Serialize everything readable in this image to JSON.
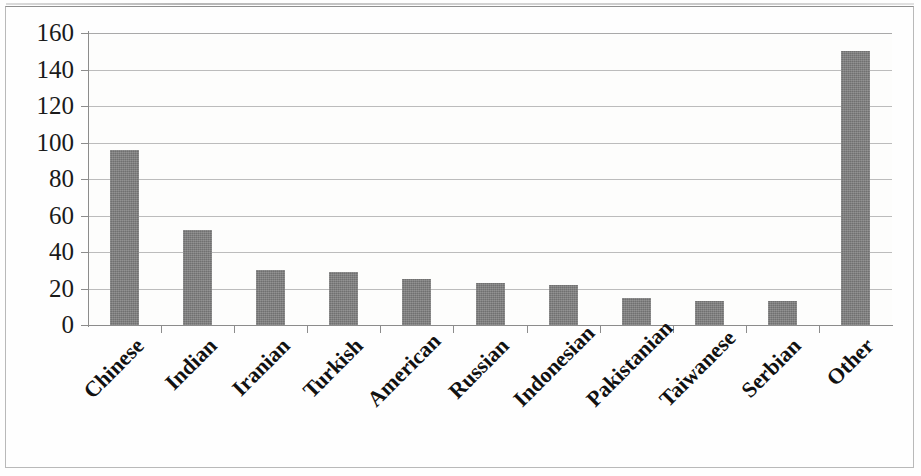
{
  "chart_data": {
    "type": "bar",
    "title": "",
    "subtitle": "",
    "xlabel": "",
    "ylabel": "",
    "categories": [
      "Chinese",
      "Indian",
      "Iranian",
      "Turkish",
      "American",
      "Russian",
      "Indonesian",
      "Pakistanian",
      "Taiwanese",
      "Serbian",
      "Other"
    ],
    "values": [
      96,
      52,
      30,
      29,
      25,
      23,
      22,
      15,
      13,
      13,
      150
    ],
    "ylim": [
      0,
      160
    ],
    "ytick_labels": [
      "160",
      "140",
      "120",
      "100",
      "80",
      "60",
      "40",
      "20",
      "0"
    ],
    "ytick_values": [
      160,
      140,
      120,
      100,
      80,
      60,
      40,
      20,
      0
    ],
    "ytick_step": 20,
    "grid": true,
    "grid_axis": "y",
    "legend": false,
    "legend_position": "none",
    "series": [
      {
        "name": "",
        "values": [
          96,
          52,
          30,
          29,
          25,
          23,
          22,
          15,
          13,
          13,
          150
        ]
      }
    ],
    "colors": {
      "bar_fill": "#7d7d7d",
      "gridline": "#b0b0b0",
      "axis": "#8c8c8c",
      "text": "#111111",
      "background": "#fdfdfc",
      "frame": "#b9b9b9"
    }
  }
}
